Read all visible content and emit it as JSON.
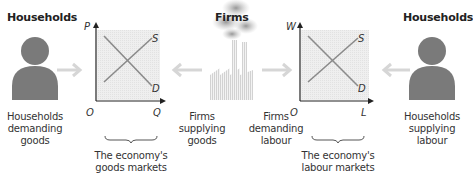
{
  "headings": {
    "left_households": "Households",
    "firms": "Firms",
    "right_households": "Households"
  },
  "captions": {
    "households_demanding": [
      "Households",
      "demanding",
      "goods"
    ],
    "firms_supplying": [
      "Firms",
      "supplying",
      "goods"
    ],
    "firms_demanding": [
      "Firms",
      "demanding",
      "labour"
    ],
    "households_supplying": [
      "Households",
      "supplying",
      "labour"
    ],
    "goods_markets": [
      "The economy's",
      "goods markets"
    ],
    "labour_markets": [
      "The economy's",
      "labour markets"
    ]
  },
  "goods_chart": {
    "y_axis": "P",
    "x_axis": "Q",
    "origin": "O",
    "supply": "S",
    "demand": "D"
  },
  "labour_chart": {
    "y_axis": "W",
    "x_axis": "L",
    "origin": "O",
    "supply": "S",
    "demand": "D"
  },
  "colors": {
    "person": "#7a7a7a",
    "arrow": "#d6d6d6",
    "chart_bg": "#ececec",
    "curve": "#8a8a8a",
    "axis": "#222222",
    "factory": "#d8d8d8",
    "smoke": "#9a9a9a"
  }
}
